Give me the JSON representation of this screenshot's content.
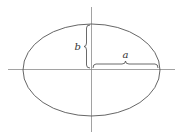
{
  "figure": {
    "labels": {
      "semi_minor": "b",
      "semi_major": "a"
    },
    "colors": {
      "axis": "#8a8a8a",
      "ellipse": "#555555",
      "brace": "#444444",
      "text": "#333333",
      "background": "#ffffff"
    }
  }
}
